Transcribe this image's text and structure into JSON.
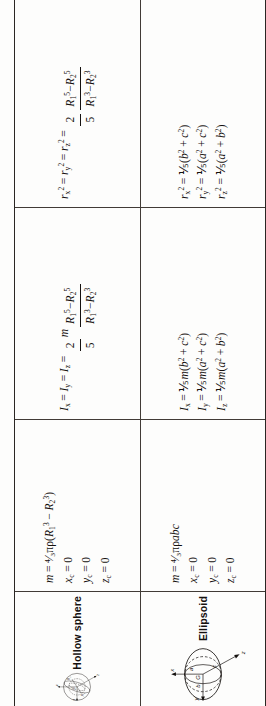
{
  "document": {
    "type": "reference-table",
    "orientation": "rotated-90-ccw",
    "columns": [
      {
        "key": "figure",
        "header": "Body and axes"
      },
      {
        "key": "mass",
        "header": "Mass and centroid"
      },
      {
        "key": "inertia",
        "header": "Mass moments of inertia"
      },
      {
        "key": "gyration",
        "header": "Squared radii of gyration"
      }
    ]
  },
  "rows": [
    {
      "name": "hollow-sphere",
      "label": "Hollow sphere",
      "figure": {
        "axes": [
          "x",
          "y",
          "z"
        ],
        "centroid_label": "G",
        "dimensions": [
          "R1",
          "R2"
        ],
        "dimension_text": {
          "r1": "R",
          "r1sub": "1",
          "r2": "R",
          "r2sub": "2"
        }
      },
      "mass": {
        "lines": [
          {
            "lhs": "m",
            "rhs_html": "mass-hollow-sphere"
          },
          {
            "lhs": "xc",
            "rhs": "0"
          },
          {
            "lhs": "yc",
            "rhs": "0"
          },
          {
            "lhs": "zc",
            "rhs": "0"
          }
        ],
        "mass_expression": "m = 4/3 pi rho (R1^3 - R2^3)",
        "xc": "0",
        "yc": "0",
        "zc": "0"
      },
      "inertia": {
        "expression": "Ix = Iy = Iz = (2/5) m (R1^5 - R2^5)/(R1^3 - R2^3)",
        "coef_num": "2",
        "coef_den": "5",
        "frac_num": "R1^5 - R2^5",
        "frac_den": "R1^3 - R2^3"
      },
      "gyration": {
        "expression": "rx^2 = ry^2 = rz^2 = (2/5)(R1^5 - R2^5)/(R1^3 - R2^3)",
        "coef_num": "2",
        "coef_den": "5",
        "frac_num": "R1^5 - R2^5",
        "frac_den": "R1^3 - R2^3"
      }
    },
    {
      "name": "ellipsoid",
      "label": "Ellipsoid",
      "figure": {
        "axes": [
          "x",
          "y",
          "z"
        ],
        "centroid_label": "G",
        "dimensions": [
          "a",
          "b",
          "c"
        ]
      },
      "mass": {
        "mass_expression": "m = 4/3 pi rho a b c",
        "xc": "0",
        "yc": "0",
        "zc": "0"
      },
      "inertia": {
        "ix": "Ix = 1/5 m (b^2 + c^2)",
        "iy": "Iy = 1/5 m (a^2 + c^2)",
        "iz": "Iz = 1/5 m (a^2 + b^2)",
        "coef": "1/5"
      },
      "gyration": {
        "rx": "rx^2 = 1/5 (b^2 + c^2)",
        "ry": "ry^2 = 1/5 (a^2 + c^2)",
        "rz": "rz^2 = 1/5 (a^2 + b^2)",
        "coef": "1/5"
      }
    }
  ],
  "symbols": {
    "I": "I",
    "r": "r",
    "m": "m",
    "R": "R",
    "G": "G",
    "x": "x",
    "y": "y",
    "z": "z",
    "a": "a",
    "b": "b",
    "c": "c",
    "pi": "π",
    "rho": "ρ",
    "equals": "=",
    "plus": "+",
    "minus": "−",
    "zero": "0",
    "one_fifth": "⅕",
    "four_thirds_pi_rho": "4/3πρ",
    "sub_c": "c",
    "sub_x": "x",
    "sub_y": "y",
    "sub_z": "z",
    "sub_1": "1",
    "sub_2": "2",
    "sup_2": "2",
    "sup_3": "3",
    "sup_5": "5",
    "paren_open": "(",
    "paren_close": ")"
  },
  "colors": {
    "ink": "#15110f",
    "rule": "#413b36",
    "paper": "#fdfdfc"
  }
}
